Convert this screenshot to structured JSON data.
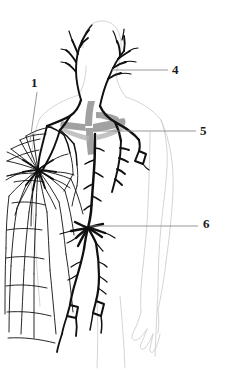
{
  "figure": {
    "background_color": "#ffffff",
    "ink_color": "#111111",
    "faint_outline_color": "#cfcfcf",
    "accent_gray": "#9a9a9a"
  },
  "labels": [
    {
      "id": "1",
      "text": "1",
      "x": 31,
      "y": 76,
      "leader": {
        "x1": 37,
        "y1": 92,
        "x2": 30,
        "y2": 141
      }
    },
    {
      "id": "4",
      "text": "4",
      "x": 172,
      "y": 63,
      "leader": {
        "x1": 112,
        "y1": 70,
        "x2": 168,
        "y2": 70
      }
    },
    {
      "id": "5",
      "text": "5",
      "x": 200,
      "y": 124,
      "leader": {
        "x1": 95,
        "y1": 131,
        "x2": 196,
        "y2": 131
      }
    },
    {
      "id": "6",
      "text": "6",
      "x": 203,
      "y": 217,
      "leader": {
        "x1": 90,
        "y1": 226,
        "x2": 198,
        "y2": 226
      }
    }
  ],
  "structures": [
    {
      "name": "cervical-lymphatics",
      "description": "branching vessels of the neck"
    },
    {
      "name": "thymus-gray-mass",
      "description": "gray shaded mediastinal mass"
    },
    {
      "name": "thoracic-duct",
      "description": "central descending trunk"
    },
    {
      "name": "axillary-node-plexus",
      "description": "radiating network at left axilla"
    },
    {
      "name": "supratrochlear-node",
      "description": "diamond node on right arm"
    },
    {
      "name": "cisterna-chyli",
      "description": "branching node at label 6 target"
    },
    {
      "name": "inguinal-nodes",
      "description": "two diamond nodes at groin"
    },
    {
      "name": "body-outline",
      "description": "faint torso, arms and hand contour"
    }
  ]
}
